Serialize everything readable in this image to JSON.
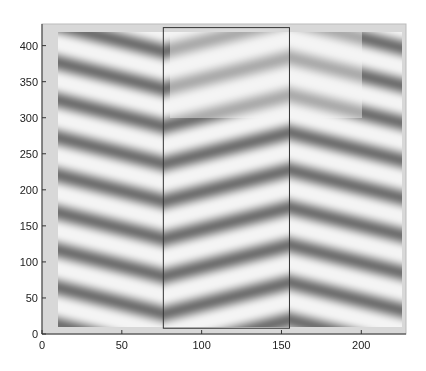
{
  "chart_data": {
    "type": "heatmap",
    "title": "",
    "xlabel": "",
    "ylabel": "",
    "colormap": "gray",
    "xlim": [
      0,
      228
    ],
    "ylim": [
      0,
      430
    ],
    "x_ticks": [
      0,
      50,
      100,
      150,
      200
    ],
    "y_ticks": [
      0,
      50,
      100,
      150,
      200,
      250,
      300,
      350,
      400
    ],
    "x_tick_labels": [
      "0",
      "50",
      "100",
      "150",
      "200"
    ],
    "y_tick_labels": [
      "0",
      "50",
      "100",
      "150",
      "200",
      "250",
      "300",
      "350",
      "400"
    ],
    "grid": false,
    "legend": "none",
    "image_extent": {
      "x": [
        10,
        225
      ],
      "y": [
        10,
        420
      ]
    },
    "pattern": {
      "description": "Diagonal periodic stripe (interference) pattern forming a chevron: stripes descend left-to-right on the left section, rise in the middle section, and descend again on the right section.",
      "stripe_period_y": 52,
      "segments": [
        {
          "x_range": [
            10,
            76
          ],
          "slope": -0.55
        },
        {
          "x_range": [
            76,
            155
          ],
          "slope": 0.55
        },
        {
          "x_range": [
            155,
            225
          ],
          "slope": -0.55
        }
      ]
    },
    "overlay_rectangle": {
      "x": [
        76,
        155
      ],
      "y": [
        8,
        425
      ],
      "color": "#333333"
    },
    "background_gray": "#d8d8d8",
    "stripe_dark": "#5a5a5a",
    "stripe_light": "#f4f4f4"
  }
}
